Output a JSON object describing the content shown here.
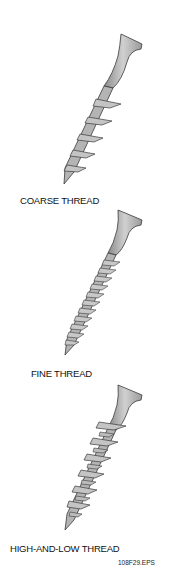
{
  "figure": {
    "id": "108F29.EPS",
    "screws": [
      {
        "label": "COARSE THREAD",
        "thread_type": "coarse"
      },
      {
        "label": "FINE THREAD",
        "thread_type": "fine"
      },
      {
        "label": "HIGH-AND-LOW THREAD",
        "thread_type": "high-and-low"
      }
    ],
    "colors": {
      "fill": "#b4b4b4",
      "outline": "#3a3a3a",
      "background": "#ffffff"
    }
  }
}
